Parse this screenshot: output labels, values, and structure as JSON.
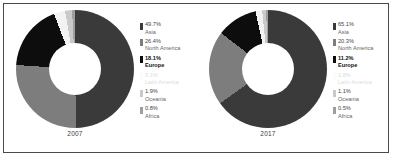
{
  "figure": {
    "background": "#ffffff",
    "border_color": "#4a4a4a"
  },
  "palette": {
    "asia": "#3a3a3a",
    "north_america": "#7d7d7d",
    "europe": "#0d0d0d",
    "latin_america": "#f2f2f2",
    "oceania": "#c9c9c9",
    "africa": "#9e9e9e"
  },
  "charts": [
    {
      "year_label": "2007",
      "legend": [
        {
          "pct": "49.7%",
          "name": "Asia",
          "color": "#3a3a3a",
          "emphasis": "normal",
          "value": 49.7
        },
        {
          "pct": "26.4%",
          "name": "North America",
          "color": "#7d7d7d",
          "emphasis": "normal",
          "value": 26.4
        },
        {
          "pct": "18.1%",
          "name": "Europe",
          "color": "#0d0d0d",
          "emphasis": "bold",
          "value": 18.1
        },
        {
          "pct": "3.1%",
          "name": "Latin America",
          "color": "#f2f2f2",
          "emphasis": "faint",
          "value": 3.1
        },
        {
          "pct": "1.9%",
          "name": "Oceania",
          "color": "#c9c9c9",
          "emphasis": "normal",
          "value": 1.9
        },
        {
          "pct": "0.8%",
          "name": "Africa",
          "color": "#9e9e9e",
          "emphasis": "normal",
          "value": 0.8
        }
      ]
    },
    {
      "year_label": "2017",
      "legend": [
        {
          "pct": "65.1%",
          "name": "Asia",
          "color": "#3a3a3a",
          "emphasis": "normal",
          "value": 65.1
        },
        {
          "pct": "20.3%",
          "name": "North America",
          "color": "#7d7d7d",
          "emphasis": "normal",
          "value": 20.3
        },
        {
          "pct": "11.2%",
          "name": "Europe",
          "color": "#0d0d0d",
          "emphasis": "bold",
          "value": 11.2
        },
        {
          "pct": "1.8%",
          "name": "Latin America",
          "color": "#f2f2f2",
          "emphasis": "faint",
          "value": 1.8
        },
        {
          "pct": "1.1%",
          "name": "Oceania",
          "color": "#c9c9c9",
          "emphasis": "normal",
          "value": 1.1
        },
        {
          "pct": "0.5%",
          "name": "Africa",
          "color": "#9e9e9e",
          "emphasis": "normal",
          "value": 0.5
        }
      ]
    }
  ],
  "chart_data": [
    {
      "type": "pie",
      "title": "2007",
      "variant": "donut",
      "hole_ratio": 0.44,
      "start_angle_deg": 0,
      "direction": "clockwise",
      "categories": [
        "Asia",
        "North America",
        "Europe",
        "Latin America",
        "Oceania",
        "Africa"
      ],
      "values": [
        49.7,
        26.4,
        18.1,
        3.1,
        1.9,
        0.8
      ],
      "unit": "percent",
      "colors": [
        "#3a3a3a",
        "#7d7d7d",
        "#0d0d0d",
        "#f2f2f2",
        "#c9c9c9",
        "#9e9e9e"
      ],
      "legend_position": "right",
      "grid": false,
      "xlabel": "",
      "ylabel": ""
    },
    {
      "type": "pie",
      "title": "2017",
      "variant": "donut",
      "hole_ratio": 0.44,
      "start_angle_deg": 0,
      "direction": "clockwise",
      "categories": [
        "Asia",
        "North America",
        "Europe",
        "Latin America",
        "Oceania",
        "Africa"
      ],
      "values": [
        65.1,
        20.3,
        11.2,
        1.8,
        1.1,
        0.5
      ],
      "unit": "percent",
      "colors": [
        "#3a3a3a",
        "#7d7d7d",
        "#0d0d0d",
        "#f2f2f2",
        "#c9c9c9",
        "#9e9e9e"
      ],
      "legend_position": "right",
      "grid": false,
      "xlabel": "",
      "ylabel": ""
    }
  ]
}
